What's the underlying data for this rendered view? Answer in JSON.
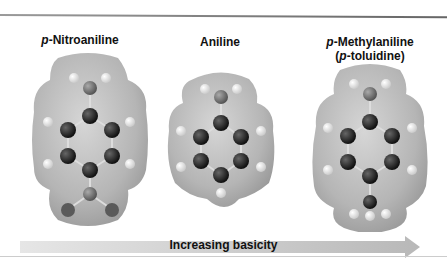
{
  "molecules": [
    {
      "name_prefix": "p",
      "name_rest": "-Nitroaniline",
      "substituent": "NO2"
    },
    {
      "name": "Aniline",
      "substituent": "H"
    },
    {
      "name_prefix": "p",
      "name_rest": "-Methylaniline",
      "alt_open": "(",
      "alt_prefix": "p",
      "alt_rest": "-toluidine)",
      "substituent": "CH3"
    }
  ],
  "arrow": {
    "label": "Increasing basicity",
    "direction": "right"
  },
  "colors": {
    "surface": "#b8b8b8",
    "carbon": "#1e1e1e",
    "nitrogen": "#6a6a6a",
    "hydrogen": "#e8e8e8",
    "oxygen": "#555555",
    "arrow": "#c8c8c8"
  }
}
